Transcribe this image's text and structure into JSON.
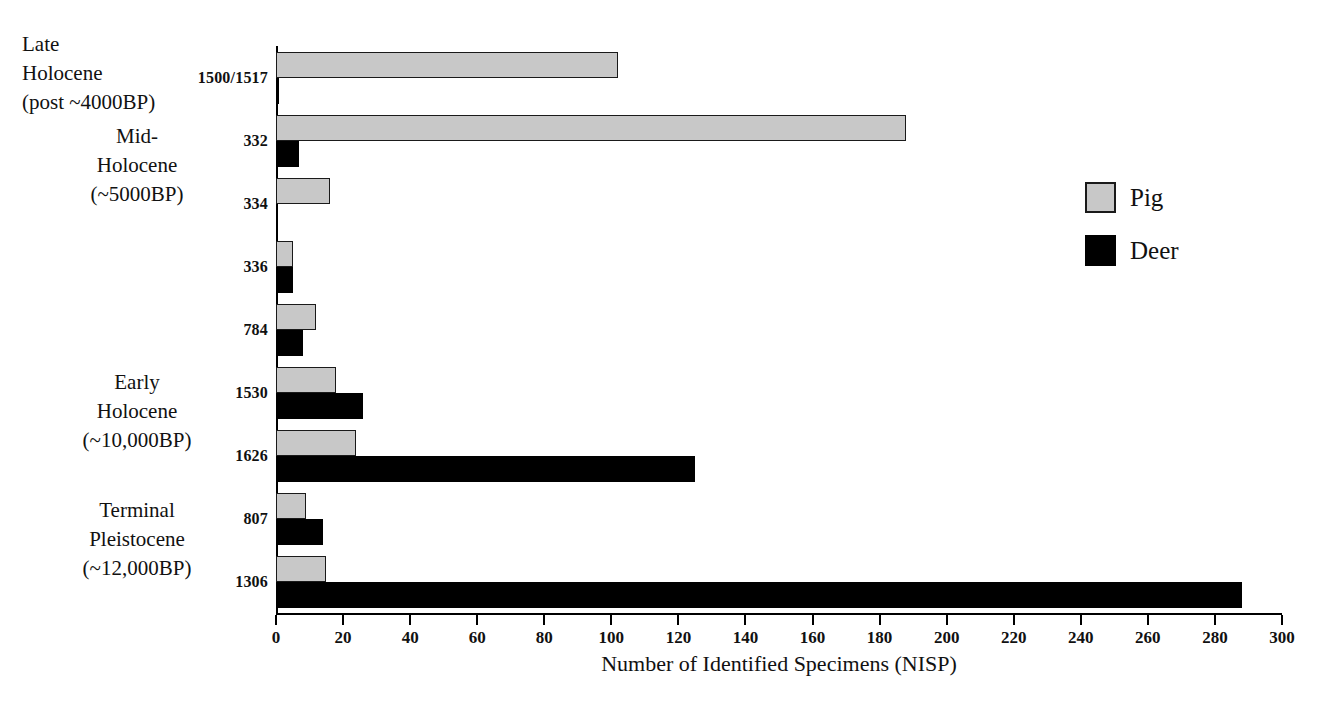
{
  "chart_data": {
    "type": "bar",
    "orientation": "horizontal",
    "title": "",
    "xlabel": "Number of Identified Specimens (NISP)",
    "ylabel": "",
    "xlim": [
      0,
      300
    ],
    "xticks": [
      0,
      20,
      40,
      60,
      80,
      100,
      120,
      140,
      160,
      180,
      200,
      220,
      240,
      260,
      280,
      300
    ],
    "grid": false,
    "legend_position": "right",
    "categories": [
      "1500/1517",
      "332",
      "334",
      "336",
      "784",
      "1530",
      "1626",
      "807",
      "1306"
    ],
    "series": [
      {
        "name": "Pig",
        "color": "#c8c8c8",
        "values": [
          102,
          188,
          16,
          5,
          12,
          18,
          24,
          9,
          15
        ]
      },
      {
        "name": "Deer",
        "color": "#000000",
        "values": [
          1,
          7,
          0,
          5,
          8,
          26,
          125,
          14,
          288
        ]
      }
    ],
    "group_labels": [
      {
        "text": "Late\nHolocene\n(post ~4000BP)",
        "categories": [
          "1500/1517"
        ]
      },
      {
        "text": "Mid-\nHolocene\n(~5000BP)",
        "categories": [
          "332",
          "334"
        ]
      },
      {
        "text": "Early\nHolocene\n(~10,000BP)",
        "categories": [
          "1530",
          "1626"
        ]
      },
      {
        "text": "Terminal\nPleistocene\n(~12,000BP)",
        "categories": [
          "807",
          "1306"
        ]
      }
    ]
  },
  "legend": {
    "items": [
      {
        "label": "Pig"
      },
      {
        "label": "Deer"
      }
    ]
  },
  "axis": {
    "x_title": "Number of Identified Specimens (NISP)"
  },
  "period_labels": {
    "late_holocene": "Late\nHolocene\n(post ~4000BP)",
    "mid_holocene": "Mid-\nHolocene\n(~5000BP)",
    "early_holocene": "Early\nHolocene\n(~10,000BP)",
    "terminal_pleistocene": "Terminal\nPleistocene\n(~12,000BP)"
  }
}
